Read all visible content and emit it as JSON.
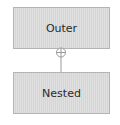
{
  "diagram": {
    "type": "uml-nesting",
    "nodes": [
      {
        "id": "outer",
        "label": "Outer"
      },
      {
        "id": "nested",
        "label": "Nested"
      }
    ],
    "edges": [
      {
        "from": "nested",
        "to": "outer",
        "relation": "containment",
        "end_symbol": "circle-plus"
      }
    ],
    "colors": {
      "box_fill": "#dcdcdc",
      "box_border": "#b4b4b4",
      "line": "#9a9a9a",
      "text": "#2a2a2a"
    }
  }
}
